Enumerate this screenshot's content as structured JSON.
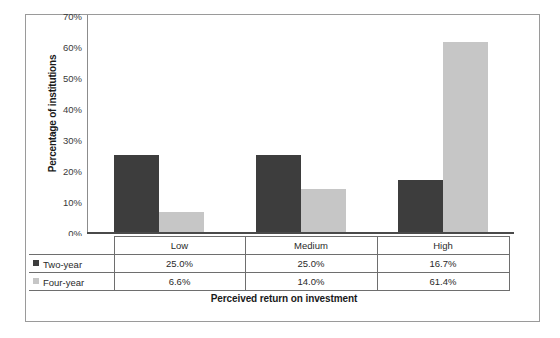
{
  "chart_data": {
    "type": "bar",
    "title": "",
    "subtitle": "",
    "xlabel": "Perceived return on investment",
    "ylabel": "Percentage of institutions",
    "categories": [
      "Low",
      "Medium",
      "High"
    ],
    "series": [
      {
        "name": "Two-year",
        "color": "#3d3d3d",
        "values": [
          25.0,
          25.0,
          16.7
        ],
        "labels": [
          "25.0%",
          "25.0%",
          "16.7%"
        ]
      },
      {
        "name": "Four-year",
        "color": "#c6c6c6",
        "values": [
          6.6,
          14.0,
          61.4
        ],
        "labels": [
          "6.6%",
          "14.0%",
          "61.4%"
        ]
      }
    ],
    "ylim": [
      0,
      70
    ],
    "ytick_values": [
      0,
      10,
      20,
      30,
      40,
      50,
      60,
      70
    ],
    "ytick_labels": [
      "0%",
      "10%",
      "20%",
      "30%",
      "40%",
      "50%",
      "60%",
      "70%"
    ],
    "grid": false,
    "legend_position": "data-table-row-headers",
    "has_data_table": true
  },
  "colors": {
    "series_two_year": "#3d3d3d",
    "series_four_year": "#c6c6c6",
    "frame_border": "#9a9a9a",
    "table_border": "#6e6e6e",
    "axis": "#4a4a4a",
    "background": "#ffffff",
    "text": "#1a1a1a"
  }
}
